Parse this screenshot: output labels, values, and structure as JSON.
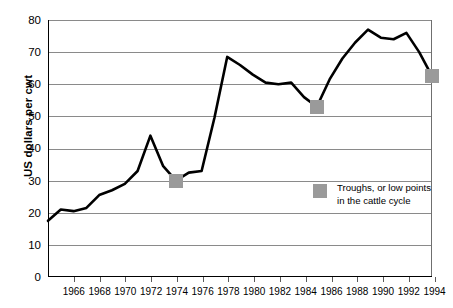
{
  "chart_data": {
    "type": "line",
    "title": "",
    "xlabel": "",
    "ylabel": "US dollars per cwt",
    "xlim": [
      1965,
      1995
    ],
    "ylim": [
      0,
      80
    ],
    "ytick_labels": [
      "0",
      "10",
      "20",
      "30",
      "40",
      "50",
      "60",
      "70",
      "80"
    ],
    "ytick_values": [
      0,
      10,
      20,
      30,
      40,
      50,
      60,
      70,
      80
    ],
    "xtick_labels": [
      "1966",
      "1968",
      "1970",
      "1972",
      "1974",
      "1976",
      "1978",
      "1980",
      "1982",
      "1984",
      "1986",
      "1988",
      "1990",
      "1992",
      "1994"
    ],
    "xtick_values": [
      1966,
      1968,
      1970,
      1972,
      1974,
      1976,
      1978,
      1980,
      1982,
      1984,
      1986,
      1988,
      1990,
      1992,
      1994
    ],
    "grid": "horizontal",
    "legend_position": "inside-right",
    "series": [
      {
        "name": "Cattle price",
        "color": "#000000",
        "x": [
          1965,
          1966,
          1967,
          1968,
          1969,
          1970,
          1971,
          1972,
          1973,
          1974,
          1975,
          1976,
          1977,
          1978,
          1979,
          1980,
          1981,
          1982,
          1983,
          1984,
          1985,
          1986,
          1987,
          1988,
          1989,
          1990,
          1991,
          1992,
          1993,
          1994,
          1995
        ],
        "values": [
          17.5,
          21.0,
          20.5,
          21.5,
          25.5,
          27.0,
          29.0,
          33.0,
          44.0,
          34.5,
          30.0,
          32.5,
          33.0,
          49.5,
          68.5,
          66.0,
          63.0,
          60.5,
          60.0,
          60.5,
          56.0,
          53.0,
          61.5,
          68.0,
          73.0,
          77.0,
          74.5,
          74.0,
          76.0,
          70.0,
          62.5
        ]
      }
    ],
    "markers": [
      {
        "label": "trough-1975",
        "x": 1975,
        "y": 30.0,
        "color": "#9a9a9a"
      },
      {
        "label": "trough-1986",
        "x": 1986,
        "y": 53.0,
        "color": "#9a9a9a"
      },
      {
        "label": "trough-1995",
        "x": 1995,
        "y": 62.5,
        "color": "#9a9a9a"
      }
    ],
    "legend": [
      {
        "swatch_color": "#9a9a9a",
        "line1": "Troughs, or low points",
        "line2": "in the cattle cycle"
      }
    ]
  }
}
